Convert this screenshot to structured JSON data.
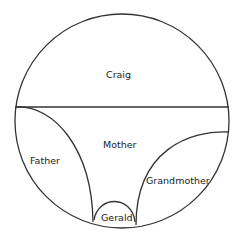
{
  "diagram": {
    "type": "family-relationship circle",
    "regions": [
      {
        "label": "Craig",
        "position": "top half"
      },
      {
        "label": "Mother",
        "position": "center"
      },
      {
        "label": "Father",
        "position": "lower left"
      },
      {
        "label": "Grandmother",
        "position": "lower right"
      },
      {
        "label": "Gerald",
        "position": "bottom center"
      }
    ]
  },
  "labels": {
    "craig": "Craig",
    "mother": "Mother",
    "father": "Father",
    "grandmother": "Grandmother",
    "gerald": "Gerald"
  }
}
